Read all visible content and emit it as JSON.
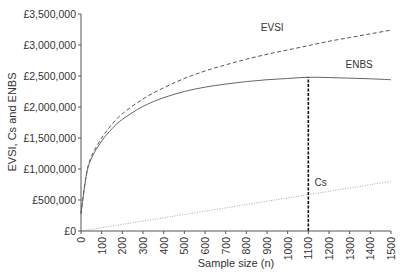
{
  "chart_data": {
    "type": "line",
    "title": "",
    "xlabel": "Sample size (n)",
    "ylabel": "EVSI, Cs and ENBS",
    "xlim": [
      0,
      1500
    ],
    "ylim": [
      0,
      3500000
    ],
    "grid": false,
    "legend": "inline labels",
    "x_ticks": [
      0,
      100,
      200,
      300,
      400,
      500,
      600,
      700,
      800,
      900,
      1000,
      1100,
      1200,
      1300,
      1400,
      1500
    ],
    "y_ticks": [
      0,
      500000,
      1000000,
      1500000,
      2000000,
      2500000,
      3000000,
      3500000
    ],
    "y_tick_labels": [
      "£0",
      "£500,000",
      "£1,000,000",
      "£1,500,000",
      "£2,000,000",
      "£2,500,000",
      "£3,000,000",
      "£3,500,000"
    ],
    "x": [
      0,
      25,
      50,
      100,
      150,
      200,
      300,
      400,
      500,
      600,
      700,
      800,
      900,
      1000,
      1100,
      1200,
      1300,
      1400,
      1500
    ],
    "series": [
      {
        "name": "EVSI",
        "style": "dashed",
        "values": [
          280000,
          900000,
          1200000,
          1500000,
          1720000,
          1890000,
          2130000,
          2310000,
          2460000,
          2580000,
          2680000,
          2770000,
          2850000,
          2920000,
          2990000,
          3060000,
          3120000,
          3180000,
          3240000
        ]
      },
      {
        "name": "ENBS",
        "style": "solid",
        "values": [
          280000,
          880000,
          1170000,
          1450000,
          1650000,
          1800000,
          2010000,
          2150000,
          2250000,
          2320000,
          2370000,
          2410000,
          2440000,
          2460000,
          2480000,
          2475000,
          2465000,
          2455000,
          2440000
        ]
      },
      {
        "name": "Cs",
        "style": "dotted",
        "values": [
          0,
          13000,
          27000,
          53000,
          80000,
          107000,
          160000,
          213000,
          267000,
          320000,
          373000,
          427000,
          480000,
          533000,
          587000,
          640000,
          693000,
          747000,
          800000
        ]
      }
    ],
    "annotations": [
      {
        "type": "vertical-dashed-line",
        "x": 1100,
        "from_y": 0,
        "to_y": 2480000,
        "meaning": "optimal sample size (max ENBS)"
      }
    ],
    "series_labels": [
      {
        "text": "EVSI",
        "x": 870,
        "y": 3220000
      },
      {
        "text": "ENBS",
        "x": 1280,
        "y": 2630000
      },
      {
        "text": "Cs",
        "x": 1130,
        "y": 720000
      }
    ]
  }
}
